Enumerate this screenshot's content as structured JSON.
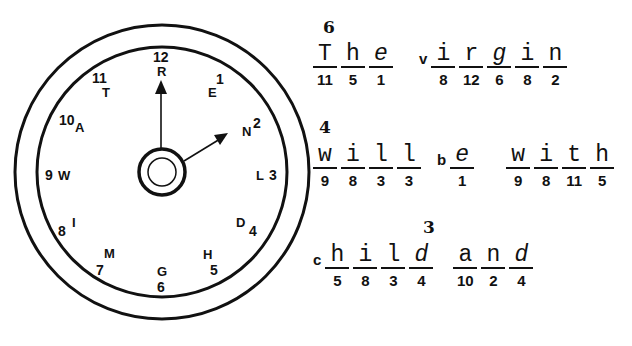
{
  "clock": {
    "positions": [
      {
        "number": "12",
        "letter": "R"
      },
      {
        "number": "1",
        "letter": "E"
      },
      {
        "number": "2",
        "letter": "N"
      },
      {
        "number": "3",
        "letter": "L"
      },
      {
        "number": "4",
        "letter": "D"
      },
      {
        "number": "5",
        "letter": "H"
      },
      {
        "number": "6",
        "letter": "G"
      },
      {
        "number": "7",
        "letter": "M"
      },
      {
        "number": "8",
        "letter": "I"
      },
      {
        "number": "9",
        "letter": "W"
      },
      {
        "number": "10",
        "letter": "A"
      },
      {
        "number": "11",
        "letter": "T"
      }
    ],
    "hour_hand_points_to": "2",
    "minute_hand_points_to": "12"
  },
  "puzzle": {
    "line1": {
      "superscript": "6",
      "words": [
        {
          "slots": [
            {
              "letter": "T",
              "num": "11"
            },
            {
              "letter": "h",
              "num": "5"
            },
            {
              "letter": "e",
              "num": "1",
              "italic": true
            }
          ]
        },
        {
          "given": "v",
          "slots": [
            {
              "letter": "i",
              "num": "8"
            },
            {
              "letter": "r",
              "num": "12"
            },
            {
              "letter": "g",
              "num": "6",
              "italic": true
            },
            {
              "letter": "i",
              "num": "8"
            },
            {
              "letter": "n",
              "num": "2"
            }
          ]
        }
      ]
    },
    "line2": {
      "superscript": "4",
      "words": [
        {
          "slots": [
            {
              "letter": "w",
              "num": "9"
            },
            {
              "letter": "i",
              "num": "8"
            },
            {
              "letter": "l",
              "num": "3"
            },
            {
              "letter": "l",
              "num": "3"
            }
          ]
        },
        {
          "given": "b",
          "slots": [
            {
              "letter": "e",
              "num": "1",
              "italic": true
            }
          ]
        },
        {
          "slots": [
            {
              "letter": "w",
              "num": "9"
            },
            {
              "letter": "i",
              "num": "8"
            },
            {
              "letter": "t",
              "num": "11"
            },
            {
              "letter": "h",
              "num": "5"
            }
          ]
        }
      ]
    },
    "line3": {
      "superscript": "3",
      "words": [
        {
          "given": "c",
          "slots": [
            {
              "letter": "h",
              "num": "5"
            },
            {
              "letter": "i",
              "num": "8"
            },
            {
              "letter": "l",
              "num": "3"
            },
            {
              "letter": "d",
              "num": "4",
              "italic": true
            }
          ]
        },
        {
          "slots": [
            {
              "letter": "a",
              "num": "10"
            },
            {
              "letter": "n",
              "num": "2"
            },
            {
              "letter": "d",
              "num": "4",
              "italic": true
            }
          ]
        }
      ]
    }
  }
}
